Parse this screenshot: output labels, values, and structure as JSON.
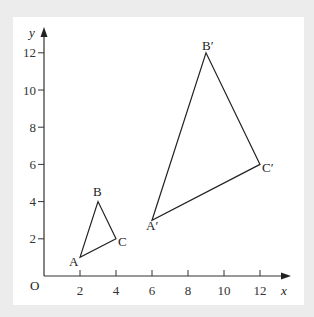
{
  "diagram": {
    "axes": {
      "x_label": "x",
      "y_label": "y",
      "origin_label": "O",
      "x_ticks": [
        "2",
        "4",
        "6",
        "8",
        "10",
        "12"
      ],
      "y_ticks": [
        "2",
        "4",
        "6",
        "8",
        "10",
        "12"
      ]
    },
    "triangles": [
      {
        "name": "ABC",
        "vertices": [
          {
            "label": "A",
            "x": 2,
            "y": 1
          },
          {
            "label": "B",
            "x": 3,
            "y": 4
          },
          {
            "label": "C",
            "x": 4,
            "y": 2
          }
        ]
      },
      {
        "name": "A'B'C'",
        "vertices": [
          {
            "label": "A′",
            "x": 6,
            "y": 3
          },
          {
            "label": "B′",
            "x": 9,
            "y": 12
          },
          {
            "label": "C′",
            "x": 12,
            "y": 6
          }
        ]
      }
    ],
    "colors": {
      "line": "#222222",
      "background": "#ececec",
      "panel": "#ffffff"
    }
  }
}
